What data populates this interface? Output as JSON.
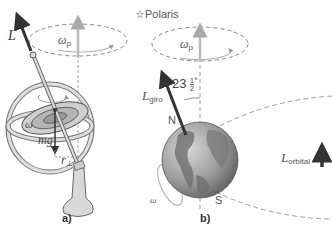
{
  "panel_a": {
    "label": "a)",
    "angular_momentum": "L",
    "precession": {
      "symbol": "ω",
      "subscript": "p"
    },
    "spin": "ω",
    "weight": {
      "symbol": "mg",
      "subscript": ""
    },
    "lever_arm": {
      "symbol": "r",
      "subscript": "⊥"
    }
  },
  "panel_b": {
    "label": "b)",
    "star": "☆",
    "star_name": "Polaris",
    "precession": {
      "symbol": "ω",
      "subscript": "p"
    },
    "tilt_angle": {
      "whole": "23",
      "num": "1",
      "den": "2",
      "unit": "°"
    },
    "spin_angular_momentum": {
      "symbol": "L",
      "subscript": "giro"
    },
    "north": "N",
    "south": "S",
    "spin": "ω",
    "orbital_angular_momentum": {
      "symbol": "L",
      "subscript": "orbital"
    }
  },
  "colors": {
    "arrow_dark": "#333333",
    "arrow_light": "#aaaaaa",
    "dashed": "#888888",
    "earth": "#8a8a8a",
    "gyro_fill": "#cfcfcf"
  }
}
